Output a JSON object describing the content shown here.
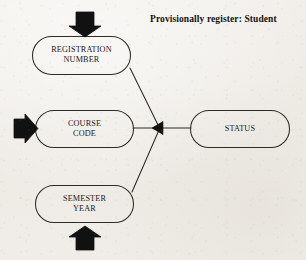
{
  "diagram": {
    "title": "Provisionally register: Student",
    "type": "data-flow-function-diagram",
    "stroke_color": "#2b2723",
    "fill_color": "#00000000",
    "arrow_color": "#111111",
    "background_color": "#f1eee9",
    "inputs": [
      {
        "id": "registration-number",
        "label": "REGISTRATION\nNUMBER",
        "line1": "REGISTRATION",
        "line2": "NUMBER",
        "arrow": "down-arrow",
        "arrow_direction": "down"
      },
      {
        "id": "course-code",
        "label": "COURSE\nCODE",
        "line1": "COURSE",
        "line2": "CODE",
        "arrow": "right-arrow",
        "arrow_direction": "right"
      },
      {
        "id": "semester-year",
        "label": "SEMESTER\nYEAR",
        "line1": "SEMESTER",
        "line2": "YEAR",
        "arrow": "up-arrow",
        "arrow_direction": "up"
      }
    ],
    "output": {
      "id": "status",
      "label": "STATUS",
      "line1": "STATUS"
    },
    "junction": {
      "id": "flow-junction",
      "marker": "left-triangle-arrowhead",
      "direction": "left"
    },
    "connectors": [
      {
        "from": "registration-number",
        "to": "flow-junction"
      },
      {
        "from": "course-code",
        "to": "flow-junction"
      },
      {
        "from": "semester-year",
        "to": "flow-junction"
      },
      {
        "from": "flow-junction",
        "to": "status"
      }
    ]
  }
}
